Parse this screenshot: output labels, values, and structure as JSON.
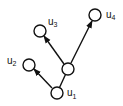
{
  "diagram": {
    "type": "tree",
    "colors": {
      "stroke": "#111111",
      "fill": "#ffffff"
    },
    "nodes": [
      {
        "id": "u1",
        "label": "u",
        "sub": "1",
        "x": 57,
        "y": 93
      },
      {
        "id": "c",
        "label": "",
        "sub": "",
        "x": 68,
        "y": 69
      },
      {
        "id": "u2",
        "label": "u",
        "sub": "2",
        "x": 29,
        "y": 65
      },
      {
        "id": "u3",
        "label": "u",
        "sub": "3",
        "x": 40,
        "y": 31
      },
      {
        "id": "u4",
        "label": "u",
        "sub": "4",
        "x": 95,
        "y": 15
      }
    ],
    "edges": [
      {
        "from": "u1",
        "to": "c",
        "arrow": false
      },
      {
        "from": "u1",
        "to": "u2",
        "arrow": true
      },
      {
        "from": "c",
        "to": "u3",
        "arrow": true
      },
      {
        "from": "c",
        "to": "u4",
        "arrow": true
      }
    ],
    "labels": {
      "u1": {
        "main": "u",
        "sub": "1"
      },
      "u2": {
        "main": "u",
        "sub": "2"
      },
      "u3": {
        "main": "u",
        "sub": "3"
      },
      "u4": {
        "main": "u",
        "sub": "4"
      }
    }
  }
}
